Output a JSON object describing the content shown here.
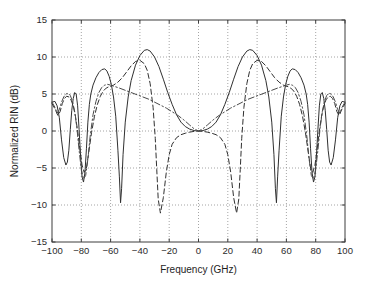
{
  "chart_data": {
    "type": "line",
    "title": "",
    "xlabel": "Frequency (GHz)",
    "ylabel": "Normalized RIN (dB)",
    "xlim": [
      -100,
      100
    ],
    "ylim": [
      -15,
      15
    ],
    "xticks": [
      -100,
      -80,
      -60,
      -40,
      -20,
      0,
      20,
      40,
      60,
      80,
      100
    ],
    "xtick_labels": [
      "-100",
      "-80",
      "-60",
      "-40",
      "-20",
      "0",
      "20",
      "40",
      "60",
      "80",
      "100"
    ],
    "yticks": [
      -15,
      -10,
      -5,
      0,
      5,
      10,
      15
    ],
    "ytick_labels": [
      "-15",
      "-10",
      "-5",
      "0",
      "5",
      "10",
      "15"
    ],
    "grid": true,
    "grid_style": "dotted",
    "legend": null,
    "legend_position": "none",
    "background": "#ffffff",
    "frame_color": "#3d3d3d",
    "series": [
      {
        "name": "solid",
        "style": "solid",
        "color": "#303030",
        "width": 1.0,
        "x": [
          -100,
          -98,
          -96.5,
          -95,
          -93.5,
          -92,
          -90.5,
          -89.5,
          -88.5,
          -87.5,
          -86.5,
          -85.5,
          -84.5,
          -83.5,
          -82.5,
          -81.5,
          -80.5,
          -79.5,
          -78.5,
          -77.5,
          -76.5,
          -75.5,
          -74.5,
          -73.5,
          -72,
          -70,
          -68,
          -66,
          -64,
          -62.5,
          -61,
          -59.5,
          -58,
          -56.5,
          -55,
          -54,
          -53.2,
          -52.5,
          -51.5,
          -50,
          -48,
          -46,
          -43,
          -40,
          -37,
          -35,
          -33,
          -30,
          -27,
          -24,
          -21,
          -18,
          -15,
          -12,
          -9,
          -6,
          -3,
          -1.5,
          0,
          1.5,
          3,
          6,
          9,
          12,
          15,
          18,
          21,
          24,
          27,
          30,
          33,
          35,
          37,
          40,
          43,
          46,
          48,
          50,
          51.5,
          52.5,
          53.2,
          54,
          55,
          56.5,
          58,
          59.5,
          61,
          62.5,
          64,
          66,
          68,
          70,
          72,
          73.5,
          74.5,
          75.5,
          76.5,
          77.5,
          78.5,
          79.5,
          80.5,
          81.5,
          82.5,
          83.5,
          84.5,
          85.5,
          86.5,
          87.5,
          88.5,
          89.5,
          90.5,
          92,
          93.5,
          95,
          96.5,
          98,
          100
        ],
        "y": [
          3.9,
          4.0,
          3.4,
          1.8,
          -1.2,
          -3.6,
          -4.6,
          -4.2,
          -2.6,
          0.2,
          2.8,
          4.4,
          5.2,
          5.0,
          3.4,
          0.2,
          -3.4,
          -6.2,
          -6.9,
          -5.6,
          -2.4,
          1.2,
          3.6,
          5.0,
          6.2,
          7.2,
          7.9,
          8.3,
          8.4,
          8.1,
          7.4,
          6.3,
          4.6,
          2.0,
          -2.6,
          -6.2,
          -9.7,
          -7.8,
          -3.2,
          1.2,
          4.6,
          6.8,
          8.9,
          10.2,
          10.9,
          11.0,
          10.8,
          10.0,
          8.7,
          7.0,
          5.2,
          3.6,
          2.2,
          1.2,
          0.6,
          0.25,
          0.06,
          0.02,
          0.0,
          0.02,
          0.06,
          0.25,
          0.6,
          1.2,
          2.2,
          3.6,
          5.2,
          7.0,
          8.7,
          10.0,
          10.8,
          11.0,
          10.9,
          10.2,
          8.9,
          6.8,
          4.6,
          1.2,
          -3.2,
          -7.8,
          -9.7,
          -6.2,
          -2.6,
          2.0,
          4.6,
          6.3,
          7.4,
          8.1,
          8.4,
          8.3,
          7.9,
          7.2,
          6.2,
          5.0,
          3.6,
          1.2,
          -2.4,
          -5.6,
          -6.9,
          -6.2,
          -3.4,
          0.2,
          3.4,
          5.0,
          5.2,
          4.4,
          2.8,
          0.2,
          -2.6,
          -4.2,
          -4.6,
          -3.6,
          -1.2,
          1.8,
          3.4,
          4.0,
          3.9
        ]
      },
      {
        "name": "dashed",
        "style": "dashed",
        "color": "#303030",
        "width": 1.0,
        "x": [
          -100,
          -98,
          -96,
          -94.5,
          -93,
          -91.5,
          -90,
          -88.5,
          -87,
          -85.5,
          -84,
          -82.5,
          -81,
          -79.5,
          -78,
          -76.5,
          -75,
          -73,
          -71,
          -69,
          -67,
          -65,
          -63,
          -61,
          -58,
          -55,
          -52,
          -49,
          -46,
          -43,
          -40,
          -37,
          -35,
          -33,
          -31,
          -29.5,
          -28.5,
          -27.5,
          -26,
          -24,
          -22,
          -20,
          -18,
          -15,
          -12,
          -9,
          -6,
          -3,
          0,
          3,
          6,
          9,
          12,
          15,
          18,
          20,
          22,
          24,
          26,
          27.5,
          28.5,
          29.5,
          31,
          33,
          35,
          37,
          40,
          43,
          46,
          49,
          52,
          55,
          58,
          61,
          63,
          65,
          67,
          69,
          71,
          73,
          75,
          76.5,
          78,
          79.5,
          81,
          82.5,
          84,
          85.5,
          87,
          88.5,
          90,
          91.5,
          93,
          94.5,
          96,
          98,
          100
        ],
        "y": [
          3.7,
          3.0,
          2.1,
          2.6,
          3.7,
          4.4,
          4.7,
          4.6,
          4.2,
          3.4,
          2.0,
          0.0,
          -2.4,
          -4.6,
          -5.6,
          -5.0,
          -3.0,
          -0.2,
          2.0,
          3.6,
          4.7,
          5.4,
          5.8,
          6.0,
          6.2,
          6.6,
          7.2,
          8.0,
          8.8,
          9.4,
          9.55,
          9.1,
          8.2,
          6.4,
          3.2,
          -1.0,
          -5.2,
          -9.2,
          -11.1,
          -9.0,
          -5.6,
          -3.2,
          -1.8,
          -0.9,
          -0.5,
          -0.3,
          -0.15,
          -0.05,
          0.0,
          -0.05,
          -0.15,
          -0.3,
          -0.5,
          -0.9,
          -1.8,
          -3.2,
          -5.6,
          -9.0,
          -11.1,
          -9.2,
          -5.2,
          -1.0,
          3.2,
          6.4,
          8.2,
          9.1,
          9.55,
          9.4,
          8.8,
          8.0,
          7.2,
          6.6,
          6.2,
          6.0,
          5.8,
          5.4,
          4.7,
          3.6,
          2.0,
          -0.2,
          -3.0,
          -5.0,
          -5.6,
          -4.6,
          -2.4,
          0.0,
          2.0,
          3.4,
          4.2,
          4.6,
          4.7,
          4.4,
          3.7,
          2.6,
          2.1,
          3.0,
          3.7
        ]
      },
      {
        "name": "dash-dot",
        "style": "dashdot",
        "color": "#4a4a4a",
        "width": 1.0,
        "x": [
          -100,
          -98,
          -96.5,
          -95,
          -93.5,
          -92,
          -90.5,
          -89,
          -87.5,
          -86,
          -84.5,
          -83,
          -81.5,
          -80,
          -78.5,
          -77,
          -75.5,
          -74,
          -72,
          -70,
          -68,
          -66,
          -64,
          -62,
          -60,
          -57,
          -54,
          -50,
          -46,
          -42,
          -38,
          -34,
          -30,
          -26,
          -22,
          -18,
          -14,
          -10,
          -6,
          -3,
          0,
          3,
          6,
          10,
          14,
          18,
          22,
          26,
          30,
          34,
          38,
          42,
          46,
          50,
          54,
          57,
          60,
          62,
          64,
          66,
          68,
          70,
          72,
          74,
          75.5,
          77,
          78.5,
          80,
          81.5,
          83,
          84.5,
          86,
          87.5,
          89,
          90.5,
          92,
          93.5,
          95,
          96.5,
          98,
          100
        ],
        "y": [
          3.9,
          3.2,
          2.4,
          2.9,
          3.9,
          4.6,
          5.0,
          5.1,
          4.8,
          4.0,
          2.6,
          0.4,
          -2.6,
          -5.2,
          -6.5,
          -6.0,
          -3.8,
          -0.8,
          2.2,
          4.0,
          5.2,
          5.9,
          6.2,
          6.3,
          6.2,
          6.0,
          5.8,
          5.5,
          5.2,
          4.9,
          4.6,
          4.3,
          3.9,
          3.5,
          3.1,
          2.6,
          2.1,
          1.5,
          0.8,
          0.3,
          0.0,
          0.3,
          0.8,
          1.5,
          2.1,
          2.6,
          3.1,
          3.5,
          3.9,
          4.3,
          4.6,
          4.9,
          5.2,
          5.5,
          5.8,
          6.0,
          6.2,
          6.3,
          6.2,
          5.9,
          5.2,
          4.0,
          2.2,
          -0.8,
          -3.8,
          -6.0,
          -6.5,
          -5.2,
          -2.6,
          0.4,
          2.6,
          4.0,
          4.8,
          5.1,
          5.0,
          4.6,
          3.9,
          2.9,
          2.4,
          3.2,
          3.9
        ]
      }
    ]
  },
  "figure": {
    "width": 370,
    "height": 283,
    "plot_left": 52,
    "plot_top": 20,
    "plot_right": 345,
    "plot_bottom": 242
  }
}
